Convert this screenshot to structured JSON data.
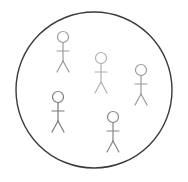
{
  "diagram": {
    "boundary": {
      "cx": 94,
      "cy": 90,
      "r": 78,
      "stroke": "#3a3a3a",
      "stroke_width": 1.4
    },
    "figures": [
      {
        "id": "figure-1",
        "x": 63,
        "y": 37,
        "color": "#9a9a9a"
      },
      {
        "id": "figure-2",
        "x": 101,
        "y": 58,
        "color": "#b0b0b0"
      },
      {
        "id": "figure-3",
        "x": 141,
        "y": 70,
        "color": "#9a9a9a"
      },
      {
        "id": "figure-4",
        "x": 58,
        "y": 97,
        "color": "#7a7a7a"
      },
      {
        "id": "figure-5",
        "x": 113,
        "y": 117,
        "color": "#858585"
      }
    ]
  }
}
